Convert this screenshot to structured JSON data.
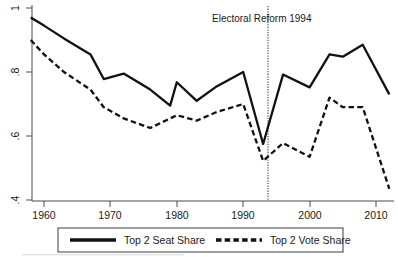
{
  "chart_data": {
    "type": "line",
    "title": "",
    "subtitle": "",
    "xlabel": "",
    "ylabel": "",
    "xlim": [
      1957,
      2013
    ],
    "ylim": [
      0.385,
      1.005
    ],
    "xticks": [
      1960,
      1970,
      1980,
      1990,
      2000,
      2010
    ],
    "xtick_labels": [
      "1960",
      "1970",
      "1980",
      "1990",
      "2000",
      "2010"
    ],
    "yticks": [
      0.4,
      0.6,
      0.8,
      1.0
    ],
    "ytick_labels": [
      ".4",
      ".6",
      ".8",
      "1"
    ],
    "grid": false,
    "legend_position": "bottom",
    "series": [
      {
        "name": "Top 2 Seat Share",
        "style": "solid",
        "color": "#111111",
        "x": [
          1958,
          1960,
          1963,
          1967,
          1969,
          1972,
          1976,
          1979,
          1980,
          1983,
          1986,
          1990,
          1993,
          1996,
          2000,
          2003,
          2005,
          2008,
          2012
        ],
        "values": [
          0.97,
          0.945,
          0.905,
          0.855,
          0.778,
          0.795,
          0.745,
          0.695,
          0.768,
          0.71,
          0.755,
          0.8,
          0.575,
          0.792,
          0.752,
          0.855,
          0.848,
          0.885,
          0.73
        ]
      },
      {
        "name": "Top 2 Vote Share",
        "style": "dashed",
        "color": "#111111",
        "x": [
          1958,
          1960,
          1963,
          1967,
          1969,
          1972,
          1976,
          1979,
          1980,
          1983,
          1986,
          1990,
          1993,
          1996,
          2000,
          2003,
          2005,
          2008,
          2012
        ],
        "values": [
          0.9,
          0.855,
          0.8,
          0.745,
          0.69,
          0.655,
          0.625,
          0.655,
          0.665,
          0.648,
          0.675,
          0.7,
          0.522,
          0.578,
          0.535,
          0.72,
          0.69,
          0.69,
          0.435
        ]
      }
    ],
    "annotations": [
      {
        "name": "electoral-reform-marker",
        "label": "Electoral Reform 1994",
        "x": 1994,
        "type": "vertical-line",
        "color": "#999999"
      }
    ]
  },
  "legend": {
    "entries": [
      {
        "label": "Top 2 Seat Share",
        "style": "solid"
      },
      {
        "label": "Top 2 Vote Share",
        "style": "dashed"
      }
    ]
  },
  "axes": {
    "y_tick_labels": [
      ".4",
      ".6",
      ".8",
      "1"
    ],
    "x_tick_labels": [
      "1960",
      "1970",
      "1980",
      "1990",
      "2000",
      "2010"
    ]
  },
  "annotation": {
    "electoral_reform": "Electoral Reform 1994"
  }
}
